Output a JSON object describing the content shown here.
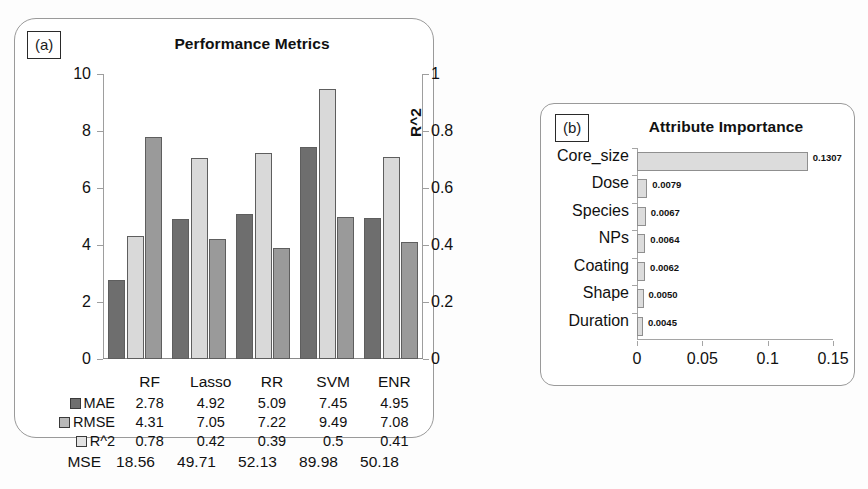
{
  "panel_a": {
    "tag": "(a)",
    "title": "Performance Metrics",
    "y_left_label": "MAE, RMSE",
    "y_right_label": "R^2",
    "y_left_ticks": [
      "0",
      "2",
      "4",
      "6",
      "8",
      "10"
    ],
    "y_right_ticks": [
      "0",
      "0.2",
      "0.4",
      "0.6",
      "0.8",
      "1"
    ],
    "legend": [
      {
        "key": "mae",
        "label": "MAE",
        "color": "#6e6e6e"
      },
      {
        "key": "rmse",
        "label": "RMSE",
        "color": "#b9b9b9"
      },
      {
        "key": "r2",
        "label": "R^2",
        "color": "#e2e2e2"
      }
    ],
    "mse": {
      "label": "MSE",
      "values": [
        "18.56",
        "49.71",
        "52.13",
        "89.98",
        "50.18"
      ]
    }
  },
  "panel_b": {
    "tag": "(b)",
    "title": "Attribute Importance",
    "x_ticks": [
      "0",
      "0.05",
      "0.1",
      "0.15"
    ]
  },
  "chart_data": [
    {
      "type": "bar",
      "title": "Performance Metrics",
      "xlabel": "",
      "ylabel": "MAE, RMSE",
      "y2label": "R^2",
      "ylim": [
        0,
        10
      ],
      "y2lim": [
        0,
        1
      ],
      "grid": false,
      "legend_position": "bottom-left",
      "categories": [
        "RF",
        "Lasso",
        "RR",
        "SVM",
        "ENR"
      ],
      "series": [
        {
          "name": "MAE",
          "axis": "left",
          "values": [
            2.78,
            4.92,
            5.09,
            7.45,
            4.95
          ],
          "color": "#6e6e6e"
        },
        {
          "name": "RMSE",
          "axis": "left",
          "values": [
            4.31,
            7.05,
            7.22,
            9.49,
            7.08
          ],
          "color": "#d9d9d9"
        },
        {
          "name": "R^2",
          "axis": "right",
          "values": [
            0.78,
            0.42,
            0.39,
            0.5,
            0.41
          ],
          "color": "#9a9a9a"
        }
      ],
      "table_rows": [
        {
          "name": "MAE",
          "values": [
            "2.78",
            "4.92",
            "5.09",
            "7.45",
            "4.95"
          ]
        },
        {
          "name": "RMSE",
          "values": [
            "4.31",
            "7.05",
            "7.22",
            "9.49",
            "7.08"
          ]
        },
        {
          "name": "R^2",
          "values": [
            "0.78",
            "0.42",
            "0.39",
            "0.5",
            "0.41"
          ]
        }
      ],
      "extra_row": {
        "name": "MSE",
        "values": [
          "18.56",
          "49.71",
          "52.13",
          "89.98",
          "50.18"
        ]
      }
    },
    {
      "type": "bar",
      "orientation": "horizontal",
      "title": "Attribute Importance",
      "xlabel": "",
      "ylabel": "",
      "xlim": [
        0,
        0.15
      ],
      "grid": false,
      "categories": [
        "Core_size",
        "Dose",
        "Species",
        "NPs",
        "Coating",
        "Shape",
        "Duration"
      ],
      "values": [
        0.1307,
        0.0079,
        0.0067,
        0.0064,
        0.0062,
        0.005,
        0.0045
      ],
      "value_labels": [
        "0.1307",
        "0.0079",
        "0.0067",
        "0.0064",
        "0.0062",
        "0.0050",
        "0.0045"
      ],
      "color": "#dcdcdc"
    }
  ]
}
